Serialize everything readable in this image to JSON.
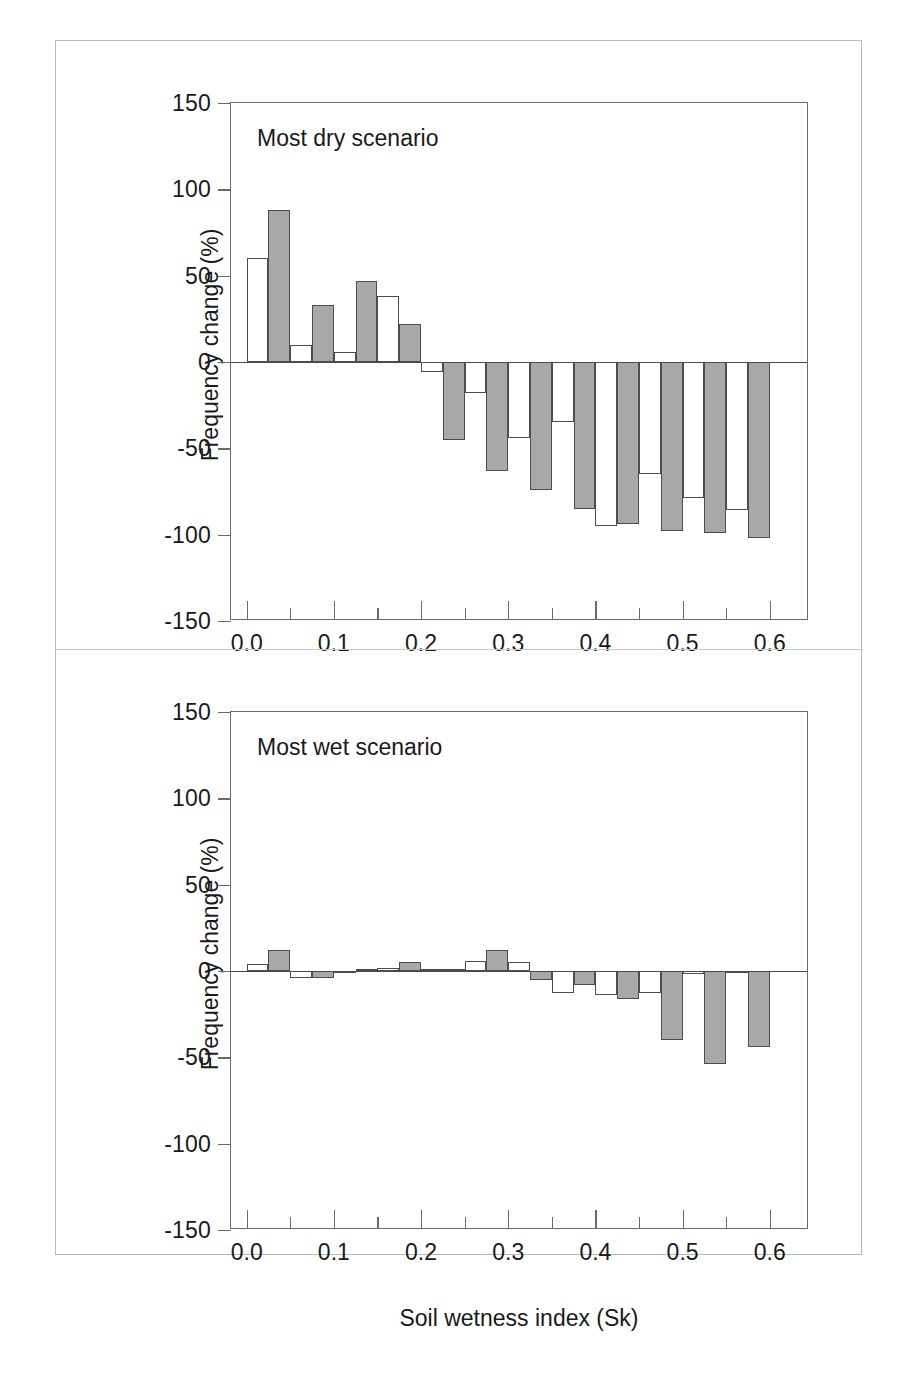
{
  "figure": {
    "axis_title_y": "Frequency change (%)",
    "axis_title_x": "Soil wetness index (Sk)",
    "colors": {
      "open_bar": "#ffffff",
      "filled_bar": "#a8a8a8",
      "outline": "#4d4d4d",
      "axis": "#6b6b6b",
      "frame": "#b9b9b9"
    }
  },
  "chart_data": [
    {
      "type": "bar",
      "title": "Most dry scenario",
      "panel": "top",
      "xlabel": "Soil wetness index (Sk)",
      "ylabel": "Frequency change (%)",
      "xlim": [
        -0.018,
        0.645
      ],
      "ylim": [
        -150,
        150
      ],
      "grid": false,
      "legend": null,
      "x_ticks_major": [
        0.0,
        0.1,
        0.2,
        0.3,
        0.4,
        0.5,
        0.6
      ],
      "x_tick_labels": [
        "0.0",
        "0.1",
        "0.2",
        "0.3",
        "0.4",
        "0.5",
        "0.6"
      ],
      "x_ticks_minor": [
        0.05,
        0.15,
        0.25,
        0.35,
        0.45,
        0.55
      ],
      "y_ticks": [
        150,
        100,
        50,
        0,
        -50,
        -100,
        -150
      ],
      "y_tick_labels": [
        "150",
        "100",
        "50",
        "0",
        "-50",
        "-100",
        "-150"
      ],
      "bin_starts": [
        0.0,
        0.05,
        0.1,
        0.15,
        0.2,
        0.25,
        0.3,
        0.35,
        0.4,
        0.45,
        0.5,
        0.55
      ],
      "series": [
        {
          "name": "open",
          "style": "open",
          "values": [
            60,
            10,
            6,
            38,
            -6,
            -18,
            -44,
            -35,
            -95,
            -65,
            -79,
            -86
          ]
        },
        {
          "name": "filled",
          "style": "filled",
          "values": [
            88,
            33,
            47,
            22,
            -45,
            -63,
            -74,
            -85,
            -94,
            -98,
            -99,
            -102
          ]
        }
      ]
    },
    {
      "type": "bar",
      "title": "Most wet scenario",
      "panel": "bottom",
      "xlabel": "Soil wetness index (Sk)",
      "ylabel": "Frequency change (%)",
      "xlim": [
        -0.018,
        0.645
      ],
      "ylim": [
        -150,
        150
      ],
      "grid": false,
      "legend": null,
      "x_ticks_major": [
        0.0,
        0.1,
        0.2,
        0.3,
        0.4,
        0.5,
        0.6
      ],
      "x_tick_labels": [
        "0.0",
        "0.1",
        "0.2",
        "0.3",
        "0.4",
        "0.5",
        "0.6"
      ],
      "x_ticks_minor": [
        0.05,
        0.15,
        0.25,
        0.35,
        0.45,
        0.55
      ],
      "y_ticks": [
        150,
        100,
        50,
        0,
        -50,
        -100,
        -150
      ],
      "y_tick_labels": [
        "150",
        "100",
        "50",
        "0",
        "-50",
        "-100",
        "-150"
      ],
      "bin_starts": [
        0.0,
        0.05,
        0.1,
        0.15,
        0.2,
        0.25,
        0.3,
        0.35,
        0.4,
        0.45,
        0.5,
        0.55
      ],
      "series": [
        {
          "name": "open",
          "style": "open",
          "values": [
            4,
            -4,
            -1,
            2,
            1,
            6,
            5,
            -13,
            -14,
            -13,
            -2,
            -1
          ]
        },
        {
          "name": "filled",
          "style": "filled",
          "values": [
            12,
            -4,
            1,
            5,
            1,
            12,
            -5,
            -8,
            -16,
            -40,
            -54,
            -44
          ]
        }
      ]
    }
  ]
}
